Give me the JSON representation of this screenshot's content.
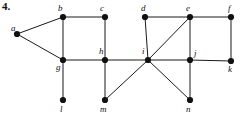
{
  "figure": {
    "number_label": "4.",
    "width": 240,
    "height": 115,
    "background_color": "#ffffff",
    "edge_color": "#1a1a1a",
    "node_color": "#111111",
    "label_color": "#111111"
  },
  "graph": {
    "type": "undirected-graph-diagram",
    "node_radius": 3.1,
    "nodes": [
      {
        "id": "a",
        "label": "a",
        "x": 17,
        "y": 34,
        "label_x": 11,
        "label_y": 24
      },
      {
        "id": "b",
        "label": "b",
        "x": 63,
        "y": 17,
        "label_x": 58,
        "label_y": 4
      },
      {
        "id": "c",
        "label": "c",
        "x": 105,
        "y": 17,
        "label_x": 100,
        "label_y": 4
      },
      {
        "id": "d",
        "label": "d",
        "x": 145,
        "y": 17,
        "label_x": 141,
        "label_y": 4
      },
      {
        "id": "e",
        "label": "e",
        "x": 190,
        "y": 17,
        "label_x": 186,
        "label_y": 4
      },
      {
        "id": "f",
        "label": "f",
        "x": 231,
        "y": 17,
        "label_x": 228,
        "label_y": 4
      },
      {
        "id": "g",
        "label": "g",
        "x": 63,
        "y": 60,
        "label_x": 56,
        "label_y": 63
      },
      {
        "id": "h",
        "label": "h",
        "x": 105,
        "y": 60,
        "label_x": 99,
        "label_y": 47
      },
      {
        "id": "i",
        "label": "i",
        "x": 148,
        "y": 60,
        "label_x": 142,
        "label_y": 47
      },
      {
        "id": "j",
        "label": "j",
        "x": 190,
        "y": 60,
        "label_x": 194,
        "label_y": 49
      },
      {
        "id": "k",
        "label": "k",
        "x": 231,
        "y": 61,
        "label_x": 228,
        "label_y": 65
      },
      {
        "id": "l",
        "label": "l",
        "x": 63,
        "y": 100,
        "label_x": 60,
        "label_y": 105
      },
      {
        "id": "m",
        "label": "m",
        "x": 105,
        "y": 100,
        "label_x": 100,
        "label_y": 105
      },
      {
        "id": "n",
        "label": "n",
        "x": 190,
        "y": 100,
        "label_x": 186,
        "label_y": 105
      }
    ],
    "edges": [
      {
        "from": "a",
        "to": "b"
      },
      {
        "from": "a",
        "to": "g"
      },
      {
        "from": "b",
        "to": "c"
      },
      {
        "from": "b",
        "to": "g"
      },
      {
        "from": "c",
        "to": "h"
      },
      {
        "from": "d",
        "to": "e"
      },
      {
        "from": "d",
        "to": "i"
      },
      {
        "from": "e",
        "to": "f"
      },
      {
        "from": "e",
        "to": "i"
      },
      {
        "from": "e",
        "to": "j"
      },
      {
        "from": "f",
        "to": "k"
      },
      {
        "from": "g",
        "to": "h"
      },
      {
        "from": "g",
        "to": "l"
      },
      {
        "from": "h",
        "to": "i"
      },
      {
        "from": "h",
        "to": "m"
      },
      {
        "from": "i",
        "to": "j"
      },
      {
        "from": "i",
        "to": "m"
      },
      {
        "from": "i",
        "to": "n"
      },
      {
        "from": "j",
        "to": "k"
      },
      {
        "from": "j",
        "to": "n"
      }
    ]
  }
}
